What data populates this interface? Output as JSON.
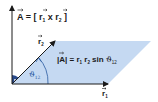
{
  "diagram": {
    "title_formula": {
      "lhs": "A",
      "eq": " = [ ",
      "r1": "r",
      "r1_sub": "1",
      "times": " x ",
      "r2": "r",
      "r2_sub": "2",
      "close": " ]"
    },
    "area_formula": {
      "lhs_open": "|",
      "lhs": "A",
      "lhs_close": "|",
      "eq": " = r",
      "r1_sub": "1",
      "r2": " r",
      "r2_sub": "2",
      "sin": " sin ",
      "theta": "ϑ",
      "theta_sub": "12"
    },
    "angle_label": {
      "theta": "ϑ",
      "theta_sub": "12"
    },
    "vector_r1_label": {
      "r": "r",
      "sub": "1"
    },
    "vector_r2_label": {
      "r": "r",
      "sub": "2"
    },
    "colors": {
      "parallelogram_fill": "#c5d9f2",
      "axis_stroke": "#1a1a1a",
      "angle_arc": "#2a5aa0",
      "right_angle_marker": "#2a4a8a"
    }
  }
}
